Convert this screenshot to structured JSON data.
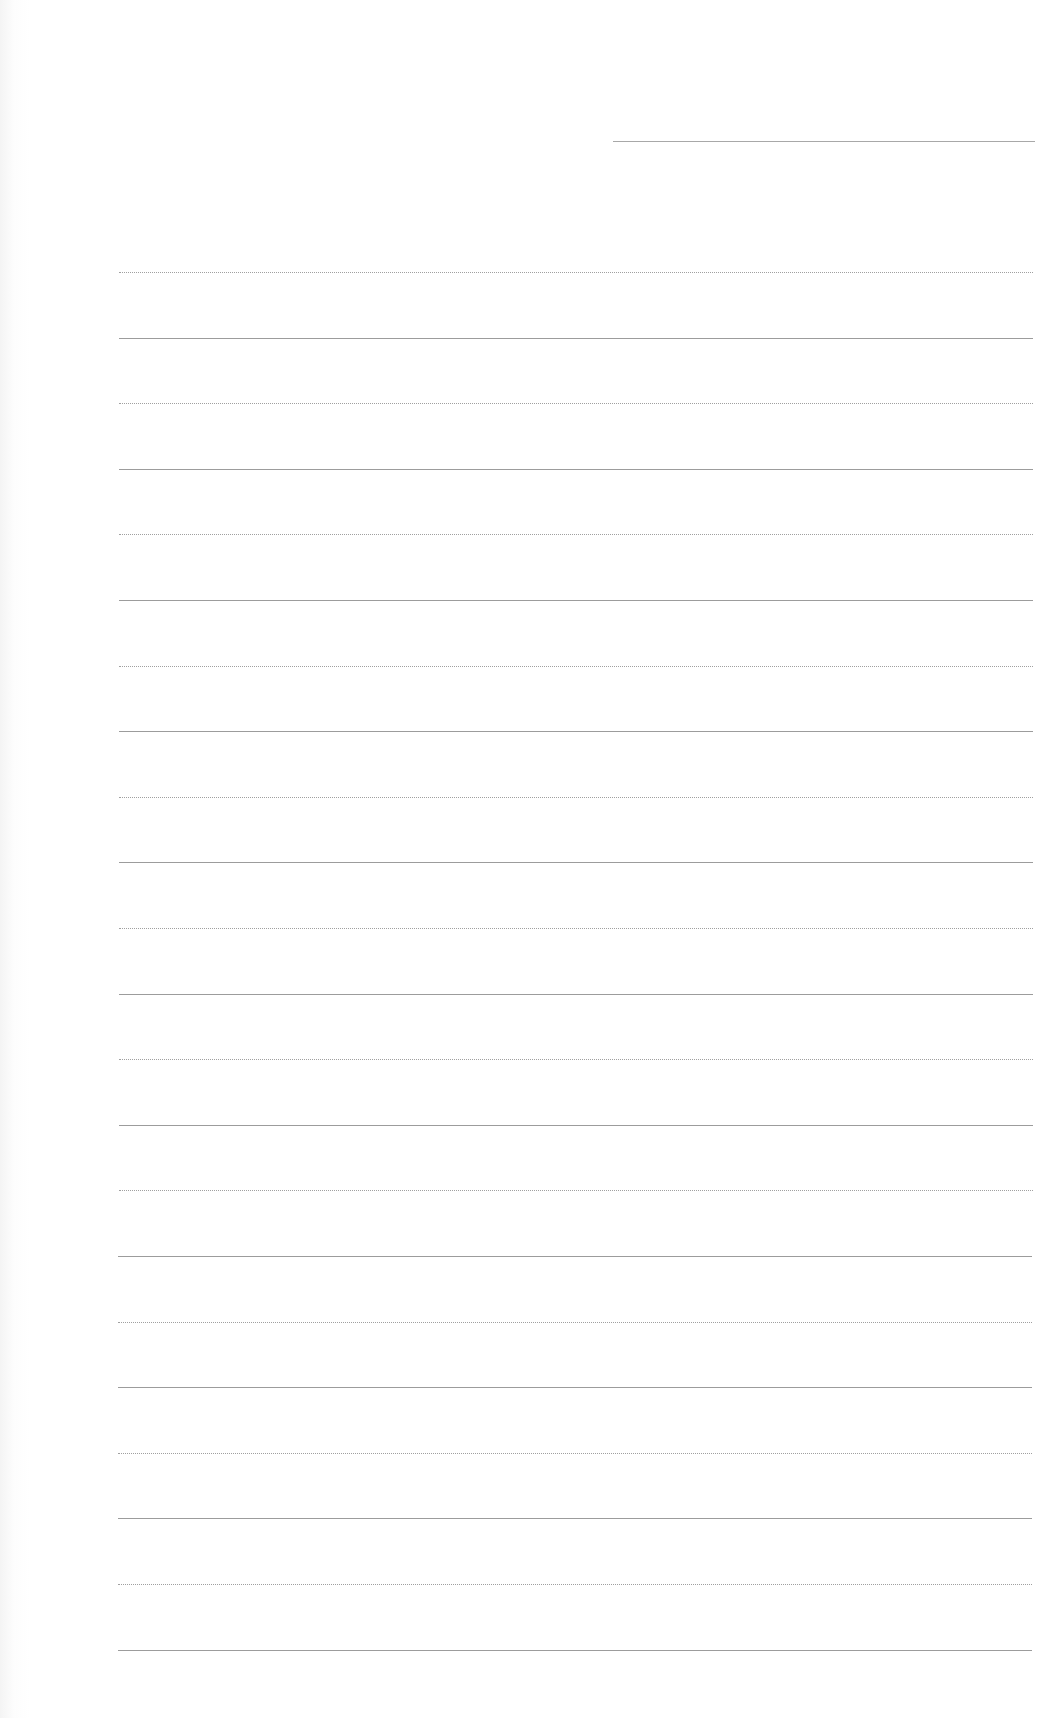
{
  "document": {
    "type": "lined-paper",
    "background_color": "#ffffff",
    "line_color": "#9c9c9c",
    "header_line": {
      "label": "",
      "x": 613,
      "y": 141,
      "width": 422
    },
    "rules": {
      "count": 22,
      "first_y": 272,
      "spacing": 65.6,
      "left": 119,
      "width": 914
    },
    "text_content": ""
  }
}
